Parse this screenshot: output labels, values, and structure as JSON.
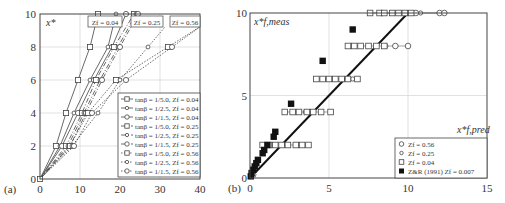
{
  "chart_data": [
    {
      "panel": "(a)",
      "type": "line",
      "xlabel": "T",
      "ylabel": "x*",
      "xlim": [
        0,
        40
      ],
      "ylim": [
        0,
        10
      ],
      "xticks": [
        "0",
        "10",
        "20",
        "30",
        "40"
      ],
      "yticks": [
        "0",
        "2",
        "4",
        "6",
        "8",
        "10"
      ],
      "grid": true,
      "annotations": [
        "Zf = 0.04",
        "Zf = 0.25",
        "Zf = 0.56"
      ],
      "legend_position": "lower right",
      "y": [
        0,
        2,
        4,
        6,
        8,
        10
      ],
      "series": [
        {
          "name": "tanβ = 1/5.0, Zf = 0.04",
          "marker": "square",
          "style": "solid",
          "values": [
            0,
            4.0,
            6.5,
            9.5,
            12.5,
            14.5
          ]
        },
        {
          "name": "tanβ = 1/2.5, Zf = 0.04",
          "marker": "diamond",
          "style": "solid",
          "values": [
            0,
            5.0,
            8.5,
            12.5,
            17.0,
            19.0
          ]
        },
        {
          "name": "tanβ = 1/1.5, Zf = 0.04",
          "marker": "circle",
          "style": "solid",
          "values": [
            0,
            5.5,
            9.5,
            13.5,
            18.0,
            21.5
          ]
        },
        {
          "name": "tanβ = 1/5.0, Zf = 0.25",
          "marker": "square",
          "style": "dashdot",
          "values": [
            0,
            6.5,
            10.5,
            14.0,
            18.5,
            23.5
          ]
        },
        {
          "name": "tanβ = 1/2.5, Zf = 0.25",
          "marker": "diamond",
          "style": "dashdot",
          "values": [
            0,
            7.0,
            11.0,
            15.0,
            19.5,
            24.0
          ]
        },
        {
          "name": "tanβ = 1/1.5, Zf = 0.25",
          "marker": "circle",
          "style": "dashdot",
          "values": [
            0,
            7.5,
            11.5,
            15.5,
            20.0,
            24.5
          ]
        },
        {
          "name": "tanβ = 1/5.0, Zf = 0.56",
          "marker": "square",
          "style": "dotted",
          "values": [
            0,
            7.5,
            12.0,
            19.0,
            32.0,
            null
          ]
        },
        {
          "name": "tanβ = 1/2.5, Zf = 0.56",
          "marker": "diamond",
          "style": "dotted",
          "values": [
            0,
            8.0,
            14.5,
            20.0,
            27.0,
            null
          ]
        },
        {
          "name": "tanβ = 1/1.5, Zf = 0.56",
          "marker": "circle",
          "style": "dotted",
          "values": [
            0,
            8.5,
            13.0,
            21.5,
            33.0,
            null
          ]
        }
      ]
    },
    {
      "panel": "(b)",
      "type": "scatter",
      "xlabel": "x*f,pred",
      "ylabel": "x*f,meas",
      "xlim": [
        0,
        15
      ],
      "ylim": [
        0,
        10
      ],
      "xticks": [
        "0",
        "5",
        "10",
        "15"
      ],
      "yticks": [
        "0",
        "5",
        "10"
      ],
      "grid": true,
      "legend_position": "lower right",
      "reference_line": {
        "x": [
          0,
          10
        ],
        "y": [
          0,
          10
        ]
      },
      "series": [
        {
          "name": "Zf = 0.56",
          "marker": "circle-open",
          "points": [
            [
              12.0,
              10
            ],
            [
              12.3,
              10
            ],
            [
              10.5,
              10
            ],
            [
              9.2,
              8
            ],
            [
              10.0,
              8
            ],
            [
              0.2,
              0.2
            ]
          ]
        },
        {
          "name": "Zf = 0.25",
          "marker": "diamond-open",
          "points": [
            [
              10.8,
              10
            ],
            [
              9.0,
              10
            ],
            [
              8.6,
              8
            ],
            [
              6.5,
              6
            ],
            [
              3.5,
              4
            ],
            [
              2.0,
              2
            ],
            [
              0.1,
              0.1
            ]
          ]
        },
        {
          "name": "Zf = 0.04",
          "marker": "square-open",
          "points": [
            [
              7.6,
              10
            ],
            [
              8.2,
              10
            ],
            [
              8.5,
              10
            ],
            [
              9.0,
              10
            ],
            [
              9.4,
              10
            ],
            [
              9.8,
              10
            ],
            [
              10.2,
              10
            ],
            [
              6.2,
              8
            ],
            [
              6.6,
              8
            ],
            [
              7.0,
              8
            ],
            [
              7.5,
              8
            ],
            [
              8.0,
              8
            ],
            [
              8.5,
              8
            ],
            [
              4.2,
              6
            ],
            [
              4.6,
              6
            ],
            [
              5.0,
              6
            ],
            [
              5.4,
              6
            ],
            [
              5.8,
              6
            ],
            [
              6.2,
              6
            ],
            [
              6.8,
              6
            ],
            [
              2.2,
              4
            ],
            [
              2.7,
              4
            ],
            [
              3.1,
              4
            ],
            [
              3.6,
              4
            ],
            [
              4.0,
              4
            ],
            [
              4.5,
              4
            ],
            [
              5.1,
              4
            ],
            [
              0.8,
              2
            ],
            [
              1.2,
              2
            ],
            [
              1.6,
              2
            ],
            [
              2.0,
              2
            ],
            [
              2.4,
              2
            ],
            [
              2.9,
              2
            ],
            [
              3.3,
              2
            ],
            [
              3.7,
              2
            ]
          ]
        },
        {
          "name": "Z&R (1991) Zf = 0.007",
          "marker": "square-filled",
          "points": [
            [
              6.5,
              9.0
            ],
            [
              4.6,
              7.1
            ],
            [
              2.6,
              4.5
            ],
            [
              1.6,
              2.8
            ],
            [
              1.5,
              2.5
            ],
            [
              1.1,
              2.0
            ],
            [
              0.9,
              1.7
            ],
            [
              0.8,
              1.5
            ],
            [
              0.5,
              1.1
            ],
            [
              0.4,
              0.9
            ],
            [
              0.3,
              0.7
            ],
            [
              0.2,
              0.5
            ],
            [
              0.1,
              0.3
            ],
            [
              0.05,
              0.1
            ]
          ]
        }
      ]
    }
  ],
  "panel_a": {
    "label": "(a)",
    "ylabel": "x*",
    "xlabel": "T",
    "xticks": [
      "0",
      "10",
      "20",
      "30",
      "40"
    ],
    "yticks": [
      "0",
      "2",
      "4",
      "6",
      "8",
      "10"
    ],
    "boxes": [
      "Zf = 0.04",
      "Zf = 0.25",
      "Zf = 0.56"
    ],
    "legend": [
      "tanβ = 1/5.0, Zf = 0.04",
      "tanβ = 1/2.5, Zf = 0.04",
      "tanβ = 1/1.5, Zf = 0.04",
      "tanβ = 1/5.0, Zf = 0.25",
      "tanβ = 1/2.5, Zf = 0.25",
      "tanβ = 1/1.5, Zf = 0.25",
      "tanβ = 1/5.0, Zf = 0.56",
      "tanβ = 1/2.5, Zf = 0.56",
      "tanβ = 1/1.5, Zf = 0.56"
    ]
  },
  "panel_b": {
    "label": "(b)",
    "ylabel": "x*f,meas",
    "xlabel": "x*f,pred",
    "xticks": [
      "0",
      "5",
      "10",
      "15"
    ],
    "yticks": [
      "0",
      "5",
      "10"
    ],
    "legend": [
      "Zf = 0.56",
      "Zf = 0.25",
      "Zf = 0.04",
      "Z&R (1991) Zf = 0.007"
    ]
  }
}
